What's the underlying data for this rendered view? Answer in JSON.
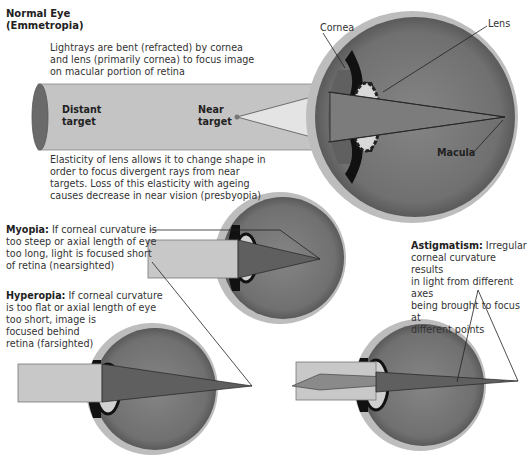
{
  "normal": {
    "title_line1": "Normal Eye",
    "title_line2": "(Emmetropia)",
    "desc_top": [
      "Lightrays are bent (refracted) by cornea",
      "and lens (primarily cornea) to focus image",
      "on macular portion of retina"
    ],
    "distant_l1": "Distant",
    "distant_l2": "target",
    "near_l1": "Near",
    "near_l2": "target",
    "cornea": "Cornea",
    "lens": "Lens",
    "macula": "Macula",
    "desc_bottom": [
      "Elasticity of lens allows it to change shape in",
      "order to focus divergent rays from near",
      "targets. Loss of this elasticity with ageing",
      "causes decrease in near vision (presbyopia)"
    ]
  },
  "myopia": {
    "term": "Myopia:",
    "lines": [
      " If corneal curvature is",
      "too steep or axial length of eye",
      "too long, light is focused short",
      "of retina (nearsighted)"
    ]
  },
  "hyperopia": {
    "term": "Hyperopia:",
    "lines": [
      " If corneal curvature",
      "is too flat or axial length of eye",
      "too short, image is",
      "focused behind",
      "retina (farsighted)"
    ]
  },
  "astigmatism": {
    "term": "Astigmatism:",
    "lines": [
      " Irregular",
      "corneal curvature results",
      "in light from different axes",
      "being brought to focus at",
      "different points"
    ]
  },
  "colors": {
    "eye_fill": "#7a7a7a",
    "sclera": "#b5b5b5",
    "beam": "#c8c8c8",
    "cone": "#5e5e5e"
  }
}
